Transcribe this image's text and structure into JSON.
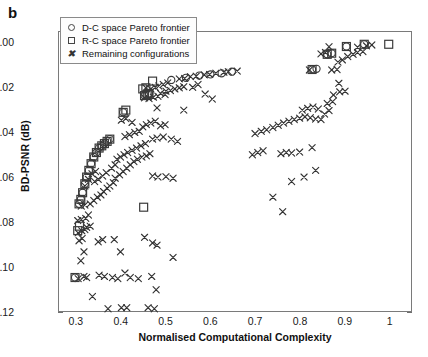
{
  "figure": {
    "panel_label": "b"
  },
  "chart_data": {
    "type": "scatter",
    "title": "",
    "xlabel": "Normalised Computational Complexity",
    "ylabel": "BD-PSNR (dB)",
    "xlim": [
      0.26,
      1.05
    ],
    "ylim": [
      -0.12,
      0.005
    ],
    "xticks": [
      "0.3",
      "0.4",
      "0.5",
      "0.6",
      "0.7",
      "0.8",
      "0.9",
      "1"
    ],
    "xtick_values": [
      0.3,
      0.4,
      0.5,
      0.6,
      0.7,
      0.8,
      0.9,
      1.0
    ],
    "yticks": [
      "0.00",
      "-0.02",
      "-0.04",
      "-0.06",
      "-0.08",
      "-0.10",
      "-0.12"
    ],
    "ytick_values": [
      0.0,
      -0.02,
      -0.04,
      -0.06,
      -0.08,
      -0.1,
      -0.12
    ],
    "grid": false,
    "legend_position": "top-left",
    "legend": [
      {
        "marker": "circle",
        "label": "D-C space Pareto frontier"
      },
      {
        "marker": "square",
        "label": "R-C space Pareto frontier"
      },
      {
        "marker": "x",
        "label": "Remaining configurations"
      }
    ],
    "series": [
      {
        "name": "D-C space Pareto frontier",
        "marker": "circle",
        "points": [
          [
            0.296,
            -0.105
          ],
          [
            0.305,
            -0.072
          ],
          [
            0.309,
            -0.07
          ],
          [
            0.313,
            -0.067
          ],
          [
            0.318,
            -0.063
          ],
          [
            0.322,
            -0.06
          ],
          [
            0.327,
            -0.057
          ],
          [
            0.332,
            -0.054
          ],
          [
            0.338,
            -0.051
          ],
          [
            0.344,
            -0.049
          ],
          [
            0.35,
            -0.047
          ],
          [
            0.356,
            -0.046
          ],
          [
            0.362,
            -0.045
          ],
          [
            0.368,
            -0.044
          ],
          [
            0.374,
            -0.043
          ],
          [
            0.404,
            -0.031
          ],
          [
            0.452,
            -0.0235
          ],
          [
            0.462,
            -0.0225
          ],
          [
            0.512,
            -0.0165
          ],
          [
            0.545,
            -0.0155
          ],
          [
            0.575,
            -0.0145
          ],
          [
            0.6,
            -0.014
          ],
          [
            0.625,
            -0.0135
          ],
          [
            0.648,
            -0.0128
          ],
          [
            0.828,
            -0.0118
          ],
          [
            0.838,
            -0.0115
          ],
          [
            0.862,
            -0.005
          ],
          [
            0.872,
            -0.0045
          ],
          [
            0.905,
            -0.0015
          ],
          [
            0.945,
            -0.0005
          ]
        ]
      },
      {
        "name": "R-C space Pareto frontier",
        "marker": "square",
        "points": [
          [
            0.296,
            -0.105
          ],
          [
            0.302,
            -0.084
          ],
          [
            0.306,
            -0.082
          ],
          [
            0.305,
            -0.072
          ],
          [
            0.309,
            -0.07
          ],
          [
            0.313,
            -0.067
          ],
          [
            0.318,
            -0.063
          ],
          [
            0.322,
            -0.06
          ],
          [
            0.327,
            -0.057
          ],
          [
            0.332,
            -0.054
          ],
          [
            0.338,
            -0.051
          ],
          [
            0.344,
            -0.049
          ],
          [
            0.35,
            -0.047
          ],
          [
            0.356,
            -0.046
          ],
          [
            0.362,
            -0.045
          ],
          [
            0.368,
            -0.044
          ],
          [
            0.374,
            -0.043
          ],
          [
            0.404,
            -0.031
          ],
          [
            0.41,
            -0.03
          ],
          [
            0.452,
            -0.0235
          ],
          [
            0.458,
            -0.023
          ],
          [
            0.462,
            -0.0225
          ],
          [
            0.448,
            -0.0205
          ],
          [
            0.455,
            -0.02
          ],
          [
            0.47,
            -0.017
          ],
          [
            0.45,
            -0.0735
          ],
          [
            0.828,
            -0.0118
          ],
          [
            0.862,
            -0.005
          ],
          [
            0.872,
            -0.0045
          ],
          [
            0.905,
            -0.0015
          ],
          [
            0.945,
            -0.0005
          ],
          [
            1.0,
            -0.0005
          ]
        ]
      },
      {
        "name": "Remaining configurations",
        "marker": "x",
        "points": [
          [
            0.303,
            -0.1055
          ],
          [
            0.316,
            -0.1045
          ],
          [
            0.322,
            -0.105
          ],
          [
            0.35,
            -0.104
          ],
          [
            0.362,
            -0.1045
          ],
          [
            0.37,
            -0.119
          ],
          [
            0.4,
            -0.1185
          ],
          [
            0.412,
            -0.1185
          ],
          [
            0.46,
            -0.1185
          ],
          [
            0.474,
            -0.119
          ],
          [
            0.335,
            -0.1135
          ],
          [
            0.309,
            -0.0975
          ],
          [
            0.38,
            -0.105
          ],
          [
            0.392,
            -0.1055
          ],
          [
            0.408,
            -0.103
          ],
          [
            0.42,
            -0.105
          ],
          [
            0.438,
            -0.1055
          ],
          [
            0.468,
            -0.1045
          ],
          [
            0.478,
            -0.1105
          ],
          [
            0.316,
            -0.0935
          ],
          [
            0.305,
            -0.0885
          ],
          [
            0.312,
            -0.0875
          ],
          [
            0.303,
            -0.085
          ],
          [
            0.311,
            -0.084
          ],
          [
            0.318,
            -0.0835
          ],
          [
            0.322,
            -0.0825
          ],
          [
            0.33,
            -0.082
          ],
          [
            0.302,
            -0.0795
          ],
          [
            0.31,
            -0.079
          ],
          [
            0.32,
            -0.0785
          ],
          [
            0.326,
            -0.077
          ],
          [
            0.348,
            -0.089
          ],
          [
            0.358,
            -0.088
          ],
          [
            0.384,
            -0.088
          ],
          [
            0.398,
            -0.0935
          ],
          [
            0.452,
            -0.087
          ],
          [
            0.47,
            -0.0895
          ],
          [
            0.48,
            -0.0905
          ],
          [
            0.516,
            -0.096
          ],
          [
            0.31,
            -0.073
          ],
          [
            0.318,
            -0.0725
          ],
          [
            0.33,
            -0.072
          ],
          [
            0.338,
            -0.0705
          ],
          [
            0.346,
            -0.069
          ],
          [
            0.354,
            -0.068
          ],
          [
            0.36,
            -0.0665
          ],
          [
            0.368,
            -0.065
          ],
          [
            0.374,
            -0.064
          ],
          [
            0.382,
            -0.0625
          ],
          [
            0.34,
            -0.062
          ],
          [
            0.348,
            -0.061
          ],
          [
            0.358,
            -0.0595
          ],
          [
            0.366,
            -0.058
          ],
          [
            0.334,
            -0.0585
          ],
          [
            0.342,
            -0.0575
          ],
          [
            0.326,
            -0.061
          ],
          [
            0.318,
            -0.064
          ],
          [
            0.386,
            -0.0605
          ],
          [
            0.396,
            -0.059
          ],
          [
            0.404,
            -0.0575
          ],
          [
            0.412,
            -0.056
          ],
          [
            0.42,
            -0.0545
          ],
          [
            0.428,
            -0.053
          ],
          [
            0.436,
            -0.052
          ],
          [
            0.446,
            -0.051
          ],
          [
            0.456,
            -0.0505
          ],
          [
            0.464,
            -0.0495
          ],
          [
            0.39,
            -0.052
          ],
          [
            0.398,
            -0.051
          ],
          [
            0.406,
            -0.05
          ],
          [
            0.414,
            -0.049
          ],
          [
            0.424,
            -0.048
          ],
          [
            0.434,
            -0.047
          ],
          [
            0.444,
            -0.046
          ],
          [
            0.454,
            -0.045
          ],
          [
            0.378,
            -0.056
          ],
          [
            0.386,
            -0.0545
          ],
          [
            0.47,
            -0.0595
          ],
          [
            0.482,
            -0.06
          ],
          [
            0.47,
            -0.043
          ],
          [
            0.48,
            -0.0425
          ],
          [
            0.494,
            -0.042
          ],
          [
            0.43,
            -0.04
          ],
          [
            0.44,
            -0.0395
          ],
          [
            0.418,
            -0.041
          ],
          [
            0.408,
            -0.0418
          ],
          [
            0.448,
            -0.0375
          ],
          [
            0.456,
            -0.0365
          ],
          [
            0.466,
            -0.0358
          ],
          [
            0.476,
            -0.035
          ],
          [
            0.4,
            -0.0345
          ],
          [
            0.41,
            -0.0338
          ],
          [
            0.424,
            -0.0355
          ],
          [
            0.488,
            -0.037
          ],
          [
            0.498,
            -0.0365
          ],
          [
            0.512,
            -0.043
          ],
          [
            0.526,
            -0.044
          ],
          [
            0.54,
            -0.03
          ],
          [
            0.48,
            -0.029
          ],
          [
            0.455,
            -0.02
          ],
          [
            0.466,
            -0.0205
          ],
          [
            0.476,
            -0.0198
          ],
          [
            0.484,
            -0.0192
          ],
          [
            0.494,
            -0.0185
          ],
          [
            0.504,
            -0.0178
          ],
          [
            0.452,
            -0.0245
          ],
          [
            0.462,
            -0.0248
          ],
          [
            0.472,
            -0.0242
          ],
          [
            0.482,
            -0.0238
          ],
          [
            0.5,
            -0.0215
          ],
          [
            0.51,
            -0.0212
          ],
          [
            0.52,
            -0.0205
          ],
          [
            0.53,
            -0.02
          ],
          [
            0.488,
            -0.0225
          ],
          [
            0.498,
            -0.023
          ],
          [
            0.53,
            -0.016
          ],
          [
            0.542,
            -0.0158
          ],
          [
            0.555,
            -0.015
          ],
          [
            0.568,
            -0.0148
          ],
          [
            0.586,
            -0.0142
          ],
          [
            0.598,
            -0.014
          ],
          [
            0.612,
            -0.0135
          ],
          [
            0.63,
            -0.013
          ],
          [
            0.64,
            -0.0128
          ],
          [
            0.66,
            -0.0125
          ],
          [
            0.54,
            -0.0195
          ],
          [
            0.56,
            -0.0198
          ],
          [
            0.572,
            -0.0185
          ],
          [
            0.588,
            -0.0228
          ],
          [
            0.604,
            -0.025
          ],
          [
            0.694,
            -0.05
          ],
          [
            0.706,
            -0.049
          ],
          [
            0.718,
            -0.0482
          ],
          [
            0.7,
            -0.0405
          ],
          [
            0.714,
            -0.0395
          ],
          [
            0.726,
            -0.0388
          ],
          [
            0.74,
            -0.0378
          ],
          [
            0.752,
            -0.0368
          ],
          [
            0.764,
            -0.0358
          ],
          [
            0.776,
            -0.035
          ],
          [
            0.788,
            -0.0342
          ],
          [
            0.8,
            -0.0336
          ],
          [
            0.812,
            -0.033
          ],
          [
            0.824,
            -0.0334
          ],
          [
            0.836,
            -0.034
          ],
          [
            0.848,
            -0.0342
          ],
          [
            0.806,
            -0.03
          ],
          [
            0.818,
            -0.0292
          ],
          [
            0.83,
            -0.0286
          ],
          [
            0.842,
            -0.0295
          ],
          [
            0.856,
            -0.0318
          ],
          [
            0.866,
            -0.0302
          ],
          [
            0.758,
            -0.0495
          ],
          [
            0.77,
            -0.049
          ],
          [
            0.782,
            -0.0492
          ],
          [
            0.8,
            -0.0488
          ],
          [
            0.828,
            -0.0468
          ],
          [
            0.782,
            -0.062
          ],
          [
            0.81,
            -0.06
          ],
          [
            0.836,
            -0.057
          ],
          [
            0.74,
            -0.069
          ],
          [
            0.762,
            -0.0755
          ],
          [
            0.862,
            -0.027
          ],
          [
            0.874,
            -0.0262
          ],
          [
            0.876,
            -0.0232
          ],
          [
            0.89,
            -0.0218
          ],
          [
            0.902,
            -0.0215
          ],
          [
            0.888,
            -0.018
          ],
          [
            0.872,
            -0.012
          ],
          [
            0.884,
            -0.0118
          ],
          [
            0.886,
            -0.0085
          ],
          [
            0.896,
            -0.0075
          ],
          [
            0.908,
            -0.006
          ],
          [
            0.92,
            -0.005
          ],
          [
            0.93,
            -0.0042
          ],
          [
            0.942,
            -0.0038
          ],
          [
            0.93,
            -0.0018
          ],
          [
            0.95,
            -0.0012
          ],
          [
            0.962,
            -0.0008
          ],
          [
            0.822,
            -0.012
          ],
          [
            0.848,
            -0.0048
          ],
          [
            0.858,
            -0.0042
          ],
          [
            0.866,
            -0.0016
          ],
          [
            0.516,
            -0.0605
          ],
          [
            0.5,
            -0.0598
          ]
        ]
      }
    ]
  }
}
